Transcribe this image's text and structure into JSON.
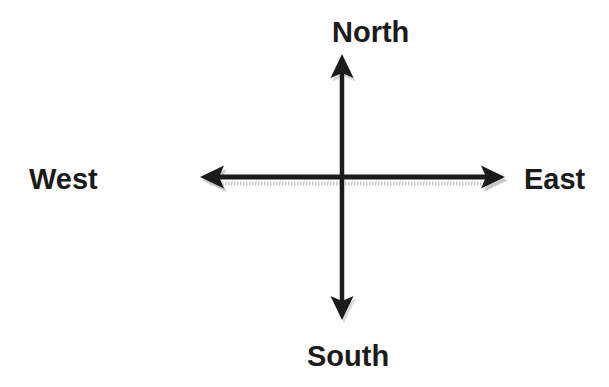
{
  "diagram": {
    "type": "compass-directions",
    "labels": {
      "north": "North",
      "south": "South",
      "east": "East",
      "west": "West"
    },
    "colors": {
      "background": "#ffffff",
      "arrow": "#1b1b1b",
      "shadow": "#9e9e9e",
      "text": "#1b1b1b"
    }
  }
}
